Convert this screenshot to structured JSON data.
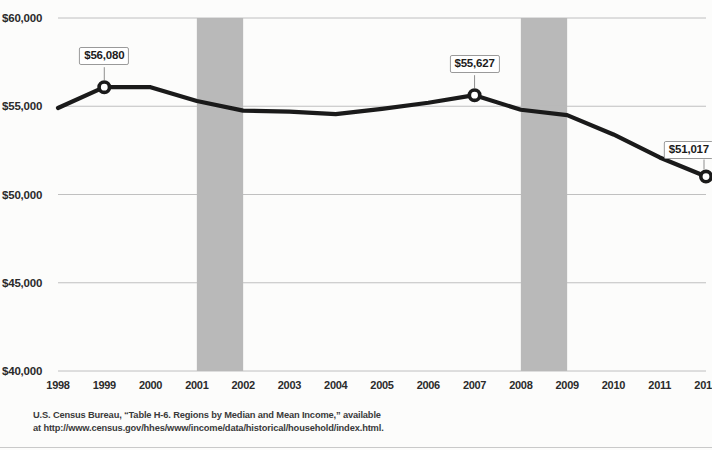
{
  "chart_data": {
    "type": "line",
    "title": "",
    "subtitle": "",
    "xlabel": "",
    "ylabel": "",
    "categories": [
      "1998",
      "1999",
      "2000",
      "2001",
      "2002",
      "2003",
      "2004",
      "2005",
      "2006",
      "2007",
      "2008",
      "2009",
      "2010",
      "2011",
      "2012"
    ],
    "values": [
      54900,
      56080,
      56080,
      55300,
      54750,
      54700,
      54550,
      54850,
      55200,
      55627,
      54800,
      54500,
      53400,
      52100,
      51017
    ],
    "ylim": [
      40000,
      60000
    ],
    "y_ticks": [
      60000,
      55000,
      50000,
      45000,
      40000
    ],
    "y_tick_labels": [
      "$60,000",
      "$55,000",
      "$50,000",
      "$45,000",
      "$40,000"
    ],
    "grid": true,
    "grid_axis": "y",
    "legend": "none",
    "line_color": "#1a1a1a",
    "marker_style": "open-circle",
    "markers_at": [
      "1999",
      "2007",
      "2012"
    ],
    "data_labels": [
      {
        "category": "1999",
        "value": 56080,
        "text": "$56,080"
      },
      {
        "category": "2007",
        "value": 55627,
        "text": "$55,627"
      },
      {
        "category": "2012",
        "value": 51017,
        "text": "$51,017"
      }
    ],
    "shaded_bands": [
      {
        "label": "recession-band-2001",
        "from": "2001",
        "to": "2002",
        "color": "#b5b5b5"
      },
      {
        "label": "recession-band-2008",
        "from": "2008",
        "to": "2009",
        "color": "#b5b5b5"
      }
    ]
  },
  "source_note": {
    "line1": "U.S. Census Bureau, “Table H-6. Regions by Median and Mean Income,” available",
    "line2": "at http://www.census.gov/hhes/www/income/data/historical/household/index.html."
  }
}
